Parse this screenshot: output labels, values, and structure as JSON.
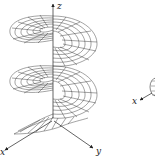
{
  "figure": {
    "type": "helicoid-surface-plot",
    "background": "#ffffff",
    "line_color": "#333333",
    "axes": {
      "z": {
        "label": "z"
      },
      "x": {
        "label": "x"
      },
      "y": {
        "label": "y"
      }
    },
    "surface": {
      "turns": 2,
      "description": "spiral ramp surface with wireframe mesh wound around the z axis"
    }
  },
  "side_figure": {
    "type": "partial-sphere-with-axis",
    "axes": {
      "x": {
        "label": "x"
      }
    }
  }
}
